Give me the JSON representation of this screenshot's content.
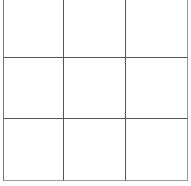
{
  "board": {
    "rows": 3,
    "cols": 3,
    "cells": [
      "",
      "",
      "",
      "",
      "",
      "",
      "",
      "",
      ""
    ]
  }
}
